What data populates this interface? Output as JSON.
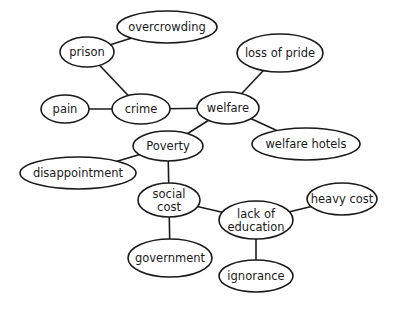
{
  "diagram": {
    "type": "concept-map",
    "line_color": "#1a1a1a",
    "background": "#ffffff",
    "nodes": [
      {
        "id": "overcrowding",
        "lines": [
          "overcrowding"
        ],
        "cx": 167,
        "cy": 27,
        "rx": 50,
        "ry": 16
      },
      {
        "id": "prison",
        "lines": [
          "prison"
        ],
        "cx": 87,
        "cy": 52,
        "rx": 27,
        "ry": 15
      },
      {
        "id": "loss-of-pride",
        "lines": [
          "loss of pride"
        ],
        "cx": 280,
        "cy": 53,
        "rx": 43,
        "ry": 19
      },
      {
        "id": "pain",
        "lines": [
          "pain"
        ],
        "cx": 65,
        "cy": 109,
        "rx": 24,
        "ry": 14
      },
      {
        "id": "crime",
        "lines": [
          "crime"
        ],
        "cx": 141,
        "cy": 109,
        "rx": 29,
        "ry": 15
      },
      {
        "id": "welfare",
        "lines": [
          "welfare"
        ],
        "cx": 228,
        "cy": 108,
        "rx": 31,
        "ry": 16
      },
      {
        "id": "poverty",
        "lines": [
          "Poverty"
        ],
        "cx": 168,
        "cy": 146,
        "rx": 35,
        "ry": 15
      },
      {
        "id": "welfare-hotels",
        "lines": [
          "welfare hotels"
        ],
        "cx": 306,
        "cy": 144,
        "rx": 54,
        "ry": 16
      },
      {
        "id": "disappointment",
        "lines": [
          "disappointment"
        ],
        "cx": 78,
        "cy": 173,
        "rx": 58,
        "ry": 16
      },
      {
        "id": "social-cost",
        "lines": [
          "social",
          "cost"
        ],
        "cx": 169,
        "cy": 200,
        "rx": 31,
        "ry": 17
      },
      {
        "id": "heavy-cost",
        "lines": [
          "heavy cost"
        ],
        "cx": 342,
        "cy": 199,
        "rx": 35,
        "ry": 16
      },
      {
        "id": "lack-of-education",
        "lines": [
          "lack of",
          "education"
        ],
        "cx": 256,
        "cy": 220,
        "rx": 37,
        "ry": 19
      },
      {
        "id": "government",
        "lines": [
          "government"
        ],
        "cx": 170,
        "cy": 258,
        "rx": 42,
        "ry": 19
      },
      {
        "id": "ignorance",
        "lines": [
          "ignorance"
        ],
        "cx": 256,
        "cy": 276,
        "rx": 37,
        "ry": 16
      }
    ],
    "edges": [
      {
        "from": "prison",
        "to": "overcrowding"
      },
      {
        "from": "prison",
        "to": "crime"
      },
      {
        "from": "pain",
        "to": "crime"
      },
      {
        "from": "crime",
        "to": "welfare"
      },
      {
        "from": "welfare",
        "to": "loss-of-pride"
      },
      {
        "from": "welfare",
        "to": "welfare-hotels"
      },
      {
        "from": "welfare",
        "to": "poverty"
      },
      {
        "from": "poverty",
        "to": "disappointment"
      },
      {
        "from": "poverty",
        "to": "social-cost"
      },
      {
        "from": "social-cost",
        "to": "lack-of-education"
      },
      {
        "from": "social-cost",
        "to": "government"
      },
      {
        "from": "lack-of-education",
        "to": "heavy-cost"
      },
      {
        "from": "lack-of-education",
        "to": "ignorance"
      }
    ]
  }
}
